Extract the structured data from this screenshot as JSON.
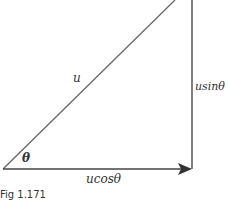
{
  "diagram": {
    "labels": {
      "hypotenuse": "u",
      "vertical": "usinθ",
      "horizontal": "ucosθ",
      "angle": "θ"
    },
    "caption": "Fig 1.171",
    "colors": {
      "line": "#555555",
      "text": "#333333"
    }
  }
}
